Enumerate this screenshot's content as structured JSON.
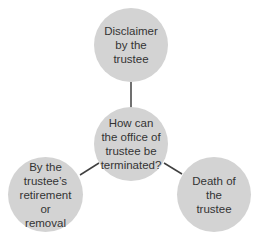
{
  "diagram": {
    "center": {
      "label": "How can the office of trustee be terminated?",
      "lines": [
        "How can",
        "the office of",
        "trustee be",
        "terminated?"
      ]
    },
    "nodes": [
      {
        "id": "top",
        "lines": [
          "Disclaimer",
          "by the",
          "trustee"
        ]
      },
      {
        "id": "left",
        "lines": [
          "By the",
          "trustee’s",
          "retirement",
          "or removal"
        ]
      },
      {
        "id": "right",
        "lines": [
          "Death of",
          "the trustee"
        ]
      }
    ],
    "colors": {
      "node_fill": "#d3d3d3",
      "line": "#404040",
      "text": "#333333"
    }
  }
}
